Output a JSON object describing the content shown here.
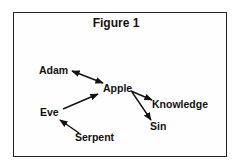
{
  "figure": {
    "title": "Figure 1",
    "nodes": [
      {
        "id": "adam",
        "label": "Adam"
      },
      {
        "id": "apple",
        "label": "Apple"
      },
      {
        "id": "eve",
        "label": "Eve"
      },
      {
        "id": "knowledge",
        "label": "Knowledge"
      },
      {
        "id": "sin",
        "label": "Sin"
      },
      {
        "id": "serpent",
        "label": "Serpent"
      }
    ],
    "edges": [
      {
        "from": "Adam",
        "to": "Apple",
        "direction": "both"
      },
      {
        "from": "Eve",
        "to": "Apple",
        "direction": "forward"
      },
      {
        "from": "Apple",
        "to": "Knowledge",
        "direction": "forward"
      },
      {
        "from": "Apple",
        "to": "Sin",
        "direction": "forward"
      },
      {
        "from": "Serpent",
        "to": "Eve",
        "direction": "forward"
      }
    ]
  }
}
